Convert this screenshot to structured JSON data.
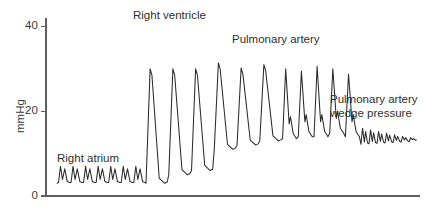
{
  "chart_data": {
    "type": "line",
    "title": "",
    "xlabel": "",
    "ylabel": "mmHg",
    "ylim": [
      0,
      42
    ],
    "yticks": [
      0,
      20,
      40
    ],
    "ytick_labels": [
      "0",
      "20",
      "40"
    ],
    "xlim": [
      0,
      100
    ],
    "grid": false,
    "legend_position": "none",
    "annotations": [
      {
        "id": "right-atrium",
        "text": "Right atrium",
        "lines": [
          "Right atrium"
        ],
        "x_px": 57,
        "y_px": 152,
        "align": "left"
      },
      {
        "id": "right-ventricle",
        "text": "Right ventricle",
        "lines": [
          "Right ventricle"
        ],
        "x_px": 133,
        "y_px": 9,
        "align": "left"
      },
      {
        "id": "pulmonary-artery",
        "text": "Pulmonary artery",
        "lines": [
          "Pulmonary artery"
        ],
        "x_px": 232,
        "y_px": 33,
        "align": "left"
      },
      {
        "id": "pulmonary-artery-wedge-pressure",
        "text": "Pulmonary artery wedge pressure",
        "lines": [
          "Pulmonary artery",
          "wedge pressure"
        ],
        "x_px": 330,
        "y_px": 93,
        "align": "left"
      }
    ],
    "series": [
      {
        "name": "catheter-pressure-trace",
        "color": "#2b2b2b",
        "description": "Continuous pressure tracing recorded as a pulmonary artery catheter advances from right atrium through right ventricle into the pulmonary artery, then to wedge position.",
        "segments": [
          {
            "id": "right-atrium",
            "label": "Right atrium",
            "x_start": 3.0,
            "x_end": 26.5,
            "beats": 7,
            "systolic": 7,
            "diastolic": 3,
            "mean": 5,
            "waveform": "atrial",
            "amplitude": 4,
            "baseline": 3
          },
          {
            "id": "right-ventricle",
            "label": "Right ventricle",
            "x_start": 26.5,
            "x_end": 63.0,
            "beats": 6,
            "systolic": 30,
            "diastolic": 3,
            "mean": 12,
            "waveform": "ventricular",
            "amplitude": 27,
            "baseline": 3
          },
          {
            "id": "pulmonary-artery",
            "label": "Pulmonary artery",
            "x_start": 63.0,
            "x_end": 84.0,
            "beats": 5,
            "systolic": 30,
            "diastolic": 14,
            "mean": 20,
            "waveform": "arterial",
            "amplitude": 16,
            "baseline": 14
          },
          {
            "id": "pulmonary-artery-wedge-pressure",
            "label": "Pulmonary artery wedge pressure",
            "x_start": 84.0,
            "x_end": 99.0,
            "beats": 7,
            "systolic": 16,
            "diastolic": 12,
            "mean": 14,
            "waveform": "wedge",
            "amplitude": 3,
            "baseline": 13
          }
        ]
      }
    ],
    "axis_geometry": {
      "left_px": 46,
      "right_px": 420,
      "top_px": 18,
      "bottom_px": 196,
      "tick_length_px": 5
    }
  }
}
